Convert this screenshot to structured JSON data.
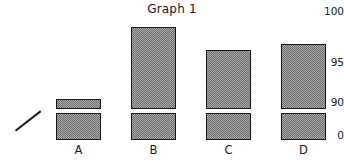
{
  "chart_data": {
    "type": "bar",
    "title": "Graph 1",
    "xlabel": "",
    "ylabel": "",
    "categories": [
      "A",
      "B",
      "C",
      "D"
    ],
    "values": [
      91.1,
      98.5,
      96.2,
      96.8
    ],
    "ylim": [
      90,
      100
    ],
    "yticks": [
      0,
      90,
      95,
      100
    ],
    "ytick_labels": [
      "0",
      "90",
      "95",
      "100"
    ],
    "axis_break": true,
    "axis_break_label": "axis-break-symbol",
    "grid": false,
    "legend": false,
    "bar_fill": "#a9a9a9",
    "bar_edge": "#151515",
    "background": "#ffffff"
  },
  "axis": {
    "tick_100": "100",
    "tick_95": "95",
    "tick_90": "90",
    "tick_0": "0"
  },
  "bars": [
    {
      "label": "A",
      "value": 91.1,
      "left": 56,
      "width": 45,
      "top": 99
    },
    {
      "label": "B",
      "value": 98.5,
      "left": 131,
      "width": 45,
      "top": 27
    },
    {
      "label": "C",
      "value": 96.2,
      "left": 206,
      "width": 45,
      "top": 50
    },
    {
      "label": "D",
      "value": 96.8,
      "left": 281,
      "width": 45,
      "top": 44
    }
  ],
  "geometry": {
    "break_upper_bottom": 109,
    "break_lower_top": 113,
    "baseline": 140
  }
}
